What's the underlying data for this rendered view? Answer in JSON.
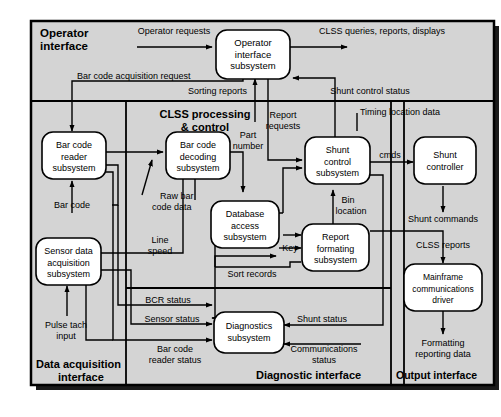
{
  "diagram": {
    "type": "block-flow-diagram",
    "background_color": "#d4d4d4",
    "box_fill": "#ffffff",
    "line_color": "#000000",
    "regions": [
      {
        "id": "operator",
        "label": "Operator\ninterface",
        "label_line1": "Operator",
        "label_line2": "interface"
      },
      {
        "id": "clss",
        "label": "CLSS processing\n& control",
        "label_line1": "CLSS processing",
        "label_line2": "& control"
      },
      {
        "id": "dataacq",
        "label": "Data acquisition\ninterface",
        "label_line1": "Data acquisition",
        "label_line2": "interface"
      },
      {
        "id": "diagnostic",
        "label": "Diagnostic interface"
      },
      {
        "id": "output",
        "label": "Output interface"
      }
    ],
    "boxes": [
      {
        "id": "operator-interface-subsystem",
        "lines": [
          "Operator",
          "interface",
          "subsystem"
        ]
      },
      {
        "id": "bar-code-reader-subsystem",
        "lines": [
          "Bar code",
          "reader",
          "subsystem"
        ]
      },
      {
        "id": "bar-code-decoding-subsystem",
        "lines": [
          "Bar code",
          "decoding",
          "subsystem"
        ]
      },
      {
        "id": "sensor-data-acquisition-subsystem",
        "lines": [
          "Sensor data",
          "acquisition",
          "subsystem"
        ]
      },
      {
        "id": "database-access-subsystem",
        "lines": [
          "Database",
          "access",
          "subsystem"
        ]
      },
      {
        "id": "shunt-control-subsystem",
        "lines": [
          "Shunt",
          "control",
          "subsystem"
        ]
      },
      {
        "id": "shunt-controller",
        "lines": [
          "Shunt",
          "controller"
        ]
      },
      {
        "id": "report-formating-subsystem",
        "lines": [
          "Report",
          "formating",
          "subsystem"
        ]
      },
      {
        "id": "diagnostics-subsystem",
        "lines": [
          "Diagnostics",
          "subsystem"
        ]
      },
      {
        "id": "mainframe-communications-driver",
        "lines": [
          "Mainframe",
          "communications",
          "driver"
        ]
      }
    ],
    "flow_labels": [
      {
        "id": "operator-requests",
        "text": "Operator requests"
      },
      {
        "id": "clss-queries-reports-displays",
        "text": "CLSS queries, reports, displays"
      },
      {
        "id": "bar-code-acquisition-request",
        "text": "Bar code acquisition request"
      },
      {
        "id": "sorting-reports",
        "text": "Sorting reports"
      },
      {
        "id": "shunt-control-status",
        "text": "Shunt control status"
      },
      {
        "id": "report-requests-l1",
        "text": "Report"
      },
      {
        "id": "report-requests-l2",
        "text": "requests"
      },
      {
        "id": "timing-location-data",
        "text": "Timing location data"
      },
      {
        "id": "part-number-l1",
        "text": "Part"
      },
      {
        "id": "part-number-l2",
        "text": "number"
      },
      {
        "id": "cmds",
        "text": "cmds"
      },
      {
        "id": "raw-bar-code-data-l1",
        "text": "Raw bar"
      },
      {
        "id": "raw-bar-code-data-l2",
        "text": "code data"
      },
      {
        "id": "bar-code",
        "text": "Bar code"
      },
      {
        "id": "line-speed-l1",
        "text": "Line"
      },
      {
        "id": "line-speed-l2",
        "text": "speed"
      },
      {
        "id": "bin-location-l1",
        "text": "Bin"
      },
      {
        "id": "bin-location-l2",
        "text": "location"
      },
      {
        "id": "shunt-commands",
        "text": "Shunt commands"
      },
      {
        "id": "clss-reports",
        "text": "CLSS reports"
      },
      {
        "id": "key",
        "text": "Key"
      },
      {
        "id": "sort-records",
        "text": "Sort records"
      },
      {
        "id": "pulse-tach-input-l1",
        "text": "Pulse tach"
      },
      {
        "id": "pulse-tach-input-l2",
        "text": "input"
      },
      {
        "id": "bcr-status",
        "text": "BCR status"
      },
      {
        "id": "sensor-status",
        "text": "Sensor status"
      },
      {
        "id": "bar-code-reader-status-l1",
        "text": "Bar code"
      },
      {
        "id": "bar-code-reader-status-l2",
        "text": "reader status"
      },
      {
        "id": "shunt-status",
        "text": "Shunt status"
      },
      {
        "id": "communications-status-l1",
        "text": "Communications"
      },
      {
        "id": "communications-status-l2",
        "text": "status"
      },
      {
        "id": "formatting-reporting-data-l1",
        "text": "Formatting"
      },
      {
        "id": "formatting-reporting-data-l2",
        "text": "reporting data"
      }
    ]
  }
}
